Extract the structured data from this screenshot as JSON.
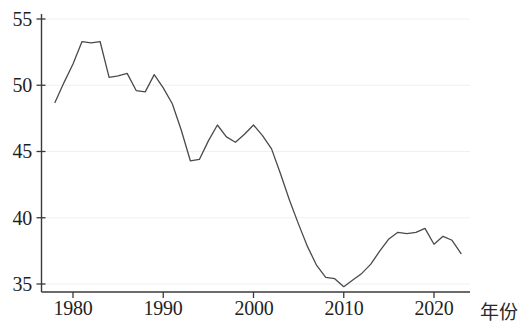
{
  "chart_data": {
    "type": "line",
    "title": "",
    "subtitle": "",
    "xlabel": "年份",
    "ylabel": "",
    "xlim": [
      1977,
      2024
    ],
    "ylim": [
      34.2,
      55.6
    ],
    "grid": true,
    "grid_orientation": "horizontal",
    "legend": "none",
    "line_color": "#4a4a4a",
    "line_width": 1.3,
    "background_color": "#ffffff",
    "axis_color": "#3a3a3a",
    "gridline_color": "#f0f0f0",
    "x_ticks": [
      1980,
      1990,
      2000,
      2010,
      2020
    ],
    "x_tick_labels": [
      "1980",
      "1990",
      "2000",
      "2010",
      "2020"
    ],
    "y_ticks": [
      35,
      40,
      45,
      50,
      55
    ],
    "y_tick_labels": [
      "35",
      "40",
      "45",
      "50",
      "55"
    ],
    "series": [
      {
        "name": "",
        "x": [
          1978,
          1979,
          1980,
          1981,
          1982,
          1983,
          1984,
          1985,
          1986,
          1987,
          1988,
          1989,
          1990,
          1991,
          1992,
          1993,
          1994,
          1995,
          1996,
          1997,
          1998,
          1999,
          2000,
          2001,
          2002,
          2003,
          2004,
          2005,
          2006,
          2007,
          2008,
          2009,
          2010,
          2011,
          2012,
          2013,
          2014,
          2015,
          2016,
          2017,
          2018,
          2019,
          2020,
          2021,
          2022,
          2023
        ],
        "values": [
          48.7,
          50.2,
          51.6,
          53.3,
          53.2,
          53.3,
          50.6,
          50.7,
          50.9,
          49.6,
          49.5,
          50.8,
          49.8,
          48.6,
          46.6,
          44.3,
          44.4,
          45.8,
          47.0,
          46.1,
          45.7,
          46.3,
          47.0,
          46.2,
          45.2,
          43.3,
          41.3,
          39.5,
          37.8,
          36.4,
          35.5,
          35.4,
          34.8,
          35.3,
          35.8,
          36.5,
          37.5,
          38.4,
          38.9,
          38.8,
          38.9,
          39.2,
          38.0,
          38.6,
          38.3,
          37.3
        ]
      }
    ]
  },
  "axes": {
    "x_axis_title": "年份",
    "y_tick_values": [
      "55",
      "50",
      "45",
      "40",
      "35"
    ],
    "x_tick_values": [
      "1980",
      "1990",
      "2000",
      "2010",
      "2020"
    ]
  }
}
